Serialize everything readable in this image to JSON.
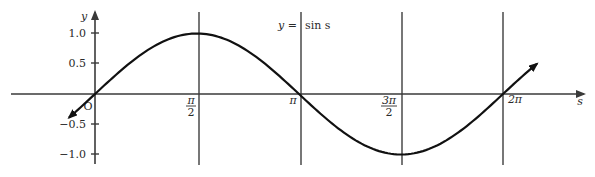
{
  "chart_data": {
    "type": "line",
    "title": "",
    "annotation": "y = sin s",
    "xlabel": "s",
    "ylabel": "y",
    "origin_label": "O",
    "function": "sin",
    "x_range": [
      -0.393,
      3.86
    ],
    "x_range_note": "in units of pi/2 steps: curve drawn from about -pi/8 to about 2pi + pi/4",
    "ylim": [
      -1.2,
      1.2
    ],
    "x_ticks": [
      {
        "value": 1.5708,
        "label": "π/2",
        "num": "π",
        "den": "2"
      },
      {
        "value": 3.1416,
        "label": "π"
      },
      {
        "value": 4.7124,
        "label": "3π/2",
        "num": "3π",
        "den": "2"
      },
      {
        "value": 6.2832,
        "label": "2π"
      }
    ],
    "y_ticks": [
      {
        "value": 1.0,
        "label": "1.0"
      },
      {
        "value": 0.5,
        "label": "0.5"
      },
      {
        "value": -0.5,
        "label": "−0.5"
      },
      {
        "value": -1.0,
        "label": "−1.0"
      }
    ],
    "vertical_gridlines_at": [
      "π/2",
      "π",
      "3π/2",
      "2π"
    ],
    "series": [
      {
        "name": "y = sin s",
        "x": [
          -0.39,
          0,
          0.785,
          1.571,
          2.356,
          3.142,
          3.927,
          4.712,
          5.498,
          6.283,
          6.68
        ],
        "values": [
          -0.38,
          0,
          0.707,
          1.0,
          0.707,
          0,
          -0.707,
          -1.0,
          -0.707,
          0,
          0.39
        ]
      }
    ],
    "arrows": "curve extends with arrowheads at both ends",
    "grid": false,
    "legend": null
  },
  "labels": {
    "y_axis": "y",
    "x_axis": "s",
    "origin": "O",
    "equation": "y = sin s",
    "eq_left": "y =",
    "eq_right": "sin s",
    "y_1": "1.0",
    "y_05": "0.5",
    "y_m05": "−0.5",
    "y_m1": "−1.0",
    "pi_half_num": "π",
    "pi_half_den": "2",
    "pi": "π",
    "three_pi_half_num": "3π",
    "three_pi_half_den": "2",
    "two_pi": "2π"
  },
  "colors": {
    "axis": "#3a3a3a",
    "gridline": "#555555",
    "curve": "#111111",
    "text": "#2a2a2a"
  }
}
